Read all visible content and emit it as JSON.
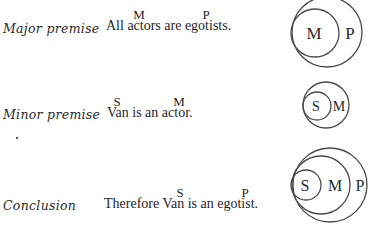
{
  "rows": [
    {
      "label": "Major premise",
      "sentence": "All actors are egotists.",
      "terms": [
        {
          "letter": "M",
          "word": "actors"
        },
        {
          "letter": "P",
          "word": "egotists"
        }
      ],
      "diagram": {
        "description": "M circle inside P circle",
        "circles": [
          {
            "letter": "P",
            "role": "outer"
          },
          {
            "letter": "M",
            "role": "inner"
          }
        ]
      }
    },
    {
      "label": "Minor premise",
      "sentence": "Van is an actor.",
      "terms": [
        {
          "letter": "S",
          "word": "Van"
        },
        {
          "letter": "M",
          "word": "actor"
        }
      ],
      "diagram": {
        "description": "S circle inside M circle",
        "circles": [
          {
            "letter": "M",
            "role": "outer"
          },
          {
            "letter": "S",
            "role": "inner"
          }
        ]
      }
    },
    {
      "label": "Conclusion",
      "sentence": "Therefore Van is an egotist.",
      "terms": [
        {
          "letter": "S",
          "word": "Van"
        },
        {
          "letter": "P",
          "word": "egotist"
        }
      ],
      "diagram": {
        "description": "S inside M inside P",
        "circles": [
          {
            "letter": "P",
            "role": "outer"
          },
          {
            "letter": "M",
            "role": "middle"
          },
          {
            "letter": "S",
            "role": "inner"
          }
        ]
      }
    }
  ]
}
